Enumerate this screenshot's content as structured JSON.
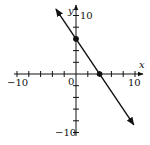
{
  "chart_data": {
    "type": "line",
    "title": "",
    "xlabel": "x",
    "ylabel": "y",
    "xlim": [
      -10,
      10
    ],
    "ylim": [
      -10,
      10
    ],
    "x_tick_step": 2,
    "y_tick_step": 2,
    "x_tick_labels": [
      "-10",
      "10"
    ],
    "y_tick_labels": [
      "10",
      "-10"
    ],
    "origin_label": "0",
    "grid": false,
    "series": [
      {
        "name": "line",
        "equation": "y = -1.5x + 6",
        "slope": -1.5,
        "intercept": 6,
        "x": [
          -3.4,
          9.8
        ],
        "y": [
          11.1,
          -8.7
        ],
        "arrows": "both"
      }
    ],
    "points": [
      {
        "x": 0,
        "y": 6,
        "label": "y-intercept"
      },
      {
        "x": 4,
        "y": 0,
        "label": "x-intercept"
      }
    ],
    "colors": {
      "axis": "#111111",
      "line": "#111111"
    }
  },
  "labels": {
    "x_axis": "x",
    "y_axis": "y",
    "x_min": "−10",
    "x_max": "10",
    "y_max": "10",
    "y_min": "−10",
    "origin": "0"
  }
}
